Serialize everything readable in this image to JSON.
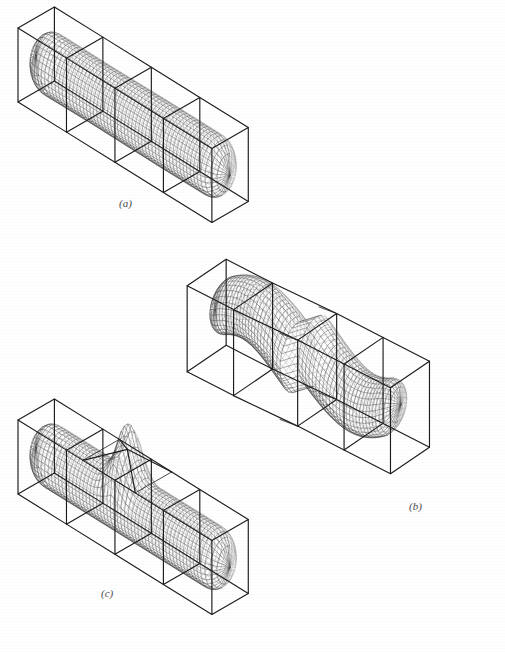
{
  "figure": {
    "title": "",
    "background_color": "#ffffff",
    "line_color": "#1c1c1c",
    "mesh_color": "#3c3c3c",
    "mesh_hidden_color": "#8d8d8d",
    "label_color": "#4a4a4a",
    "width": 505,
    "height": 652,
    "panel_count": 3
  },
  "panels": [
    {
      "id": "a",
      "label": "(a)",
      "label_x": 119,
      "label_y": 207,
      "description": "straight rounded tube inside a four-segment rectangular cage",
      "shape": "straight-tube",
      "cage": {
        "type": "box",
        "segments": 4,
        "origin_x": 18,
        "origin_y": 28,
        "axis_len": 262,
        "width": 70,
        "height": 74,
        "skew_x": 0.74,
        "skew_y": 0.46,
        "depth_x": 0.52,
        "depth_y": -0.3
      },
      "surface": {
        "type": "capsule",
        "radius": 30,
        "bulge": [
          1.0,
          0.98,
          1.0,
          0.99
        ],
        "u_steps": 56,
        "v_steps": 30
      }
    },
    {
      "id": "b",
      "label": "(b)",
      "label_x": 409,
      "label_y": 510,
      "description": "S-bent tube inside a stepped polyhedral cage with two offset box sections",
      "shape": "bent-tube",
      "cage": {
        "type": "stepped-box",
        "segments": 4,
        "origin_x": 196,
        "origin_y": 285,
        "axis_len": 238,
        "width": 78,
        "height": 86,
        "step_offset": 52,
        "skew_x": 0.78,
        "skew_y": 0.4,
        "depth_x": 0.5,
        "depth_y": -0.34
      },
      "surface": {
        "type": "capsule-bent",
        "radius": 34,
        "bend_amount": 50,
        "u_steps": 54,
        "v_steps": 30
      }
    },
    {
      "id": "c",
      "label": "(c)",
      "label_x": 101,
      "label_y": 597,
      "description": "straight rounded tube with a pyramidal spike on top inside a four-segment rectangular cage",
      "shape": "tube-with-spike",
      "cage": {
        "type": "box",
        "segments": 4,
        "origin_x": 18,
        "origin_y": 420,
        "axis_len": 262,
        "width": 70,
        "height": 74,
        "skew_x": 0.74,
        "skew_y": 0.46,
        "depth_x": 0.52,
        "depth_y": -0.3
      },
      "surface": {
        "type": "capsule-spike",
        "radius": 30,
        "spike_at": 0.47,
        "spike_height": 56,
        "u_steps": 56,
        "v_steps": 30
      }
    }
  ]
}
